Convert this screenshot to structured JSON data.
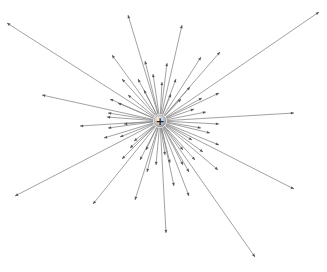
{
  "diagram": {
    "title": "",
    "center": {
      "x": 160,
      "y": 121
    },
    "charge": {
      "sign_label": "+",
      "radius": 6,
      "fill_color": "#bdbdbd",
      "edge_color": "#8c8c8c"
    },
    "line_color": "#8a8a8a",
    "arrow_color": "#555555",
    "field_lines": [
      {
        "x": 7,
        "y": 23
      },
      {
        "x": 128,
        "y": 15
      },
      {
        "x": 182,
        "y": 25
      },
      {
        "x": 220,
        "y": 52
      },
      {
        "x": 319,
        "y": 12
      },
      {
        "x": 294,
        "y": 113
      },
      {
        "x": 294,
        "y": 189
      },
      {
        "x": 255,
        "y": 257
      },
      {
        "x": 166,
        "y": 233
      },
      {
        "x": 189,
        "y": 196
      },
      {
        "x": 135,
        "y": 200
      },
      {
        "x": 93,
        "y": 204
      },
      {
        "x": 15,
        "y": 196
      },
      {
        "x": 42,
        "y": 95
      },
      {
        "x": 80,
        "y": 126
      },
      {
        "x": 112,
        "y": 55
      },
      {
        "x": 145,
        "y": 61
      },
      {
        "x": 167,
        "y": 63
      },
      {
        "x": 201,
        "y": 57
      },
      {
        "x": 219,
        "y": 93
      },
      {
        "x": 219,
        "y": 124
      },
      {
        "x": 219,
        "y": 145
      },
      {
        "x": 218,
        "y": 170
      },
      {
        "x": 189,
        "y": 172
      },
      {
        "x": 174,
        "y": 186
      },
      {
        "x": 147,
        "y": 172
      },
      {
        "x": 122,
        "y": 159
      },
      {
        "x": 104,
        "y": 138
      },
      {
        "x": 110,
        "y": 99
      },
      {
        "x": 122,
        "y": 79
      },
      {
        "x": 138,
        "y": 79
      },
      {
        "x": 153,
        "y": 74
      },
      {
        "x": 162,
        "y": 82
      },
      {
        "x": 176,
        "y": 79
      },
      {
        "x": 190,
        "y": 87
      },
      {
        "x": 202,
        "y": 98
      },
      {
        "x": 206,
        "y": 112
      },
      {
        "x": 210,
        "y": 133
      },
      {
        "x": 203,
        "y": 152
      },
      {
        "x": 195,
        "y": 160
      },
      {
        "x": 183,
        "y": 165
      },
      {
        "x": 170,
        "y": 163
      },
      {
        "x": 156,
        "y": 165
      },
      {
        "x": 140,
        "y": 160
      },
      {
        "x": 130,
        "y": 148
      },
      {
        "x": 120,
        "y": 137
      },
      {
        "x": 108,
        "y": 128
      },
      {
        "x": 107,
        "y": 117
      },
      {
        "x": 108,
        "y": 113
      },
      {
        "x": 118,
        "y": 103
      },
      {
        "x": 128,
        "y": 95
      },
      {
        "x": 144,
        "y": 90
      },
      {
        "x": 171,
        "y": 94
      },
      {
        "x": 181,
        "y": 99
      },
      {
        "x": 194,
        "y": 109
      },
      {
        "x": 201,
        "y": 128
      },
      {
        "x": 192,
        "y": 140
      },
      {
        "x": 183,
        "y": 150
      },
      {
        "x": 165,
        "y": 155
      },
      {
        "x": 146,
        "y": 150
      },
      {
        "x": 134,
        "y": 141
      },
      {
        "x": 124,
        "y": 124
      }
    ]
  }
}
